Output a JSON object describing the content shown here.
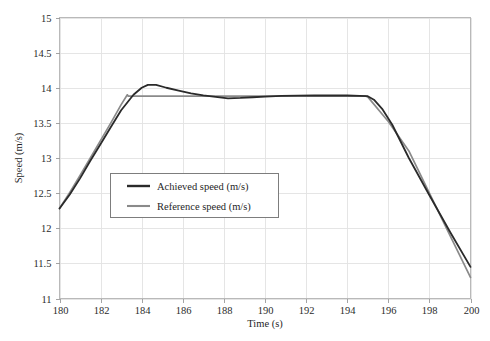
{
  "chart_data": {
    "type": "line",
    "title": "",
    "xlabel": "Time (s)",
    "ylabel": "Speed (m/s)",
    "xlim": [
      180,
      200
    ],
    "ylim": [
      11,
      15
    ],
    "xticks": [
      180,
      182,
      184,
      186,
      188,
      190,
      192,
      194,
      196,
      198,
      200
    ],
    "yticks": [
      11,
      11.5,
      12,
      12.5,
      13,
      13.5,
      14,
      14.5,
      15
    ],
    "xtick_labels": [
      "180",
      "182",
      "184",
      "186",
      "188",
      "190",
      "192",
      "194",
      "196",
      "198",
      "200"
    ],
    "ytick_labels": [
      "11",
      "11.5",
      "12",
      "12.5",
      "13",
      "13.5",
      "14",
      "14.5",
      "15"
    ],
    "grid": true,
    "legend_position": "center-left",
    "series": [
      {
        "name": "Achieved speed (m/s)",
        "color": "#2a2a2a",
        "width": 1.8,
        "x": [
          180.0,
          180.5,
          181.0,
          181.5,
          182.0,
          182.5,
          183.0,
          183.3,
          183.6,
          184.0,
          184.3,
          184.7,
          185.2,
          185.8,
          186.4,
          187.0,
          187.6,
          188.2,
          188.8,
          189.4,
          190.0,
          190.8,
          191.6,
          192.4,
          193.2,
          194.0,
          194.6,
          195.0,
          195.3,
          195.7,
          196.2,
          197.0,
          198.0,
          199.0,
          200.0
        ],
        "y": [
          12.28,
          12.48,
          12.71,
          12.96,
          13.2,
          13.44,
          13.68,
          13.79,
          13.9,
          14.0,
          14.04,
          14.04,
          14.0,
          13.96,
          13.92,
          13.89,
          13.87,
          13.85,
          13.855,
          13.865,
          13.875,
          13.885,
          13.888,
          13.89,
          13.89,
          13.89,
          13.885,
          13.88,
          13.83,
          13.7,
          13.47,
          13.0,
          12.47,
          11.95,
          11.45
        ]
      },
      {
        "name": "Reference speed (m/s)",
        "color": "#8a8a8a",
        "width": 1.7,
        "x": [
          180.0,
          180.5,
          181.0,
          181.5,
          182.0,
          182.5,
          183.0,
          183.3,
          183.35,
          184.0,
          186.0,
          188.0,
          190.0,
          192.0,
          194.0,
          194.9,
          195.0,
          196.0,
          197.0,
          198.0,
          199.0,
          200.0
        ],
        "y": [
          12.28,
          12.51,
          12.75,
          13.0,
          13.25,
          13.5,
          13.76,
          13.9,
          13.88,
          13.88,
          13.88,
          13.88,
          13.88,
          13.88,
          13.88,
          13.88,
          13.87,
          13.52,
          13.1,
          12.5,
          11.9,
          11.3
        ]
      }
    ]
  },
  "legend": {
    "entries": [
      {
        "label": "Achieved speed (m/s)",
        "swatch": "achieved-line-swatch"
      },
      {
        "label": "Reference speed (m/s)",
        "swatch": "reference-line-swatch"
      }
    ]
  },
  "colors": {
    "achieved": "#2a2a2a",
    "reference": "#8a8a8a",
    "grid": "#e2e2e2",
    "border": "#b9b9b9",
    "background": "#ffffff"
  }
}
